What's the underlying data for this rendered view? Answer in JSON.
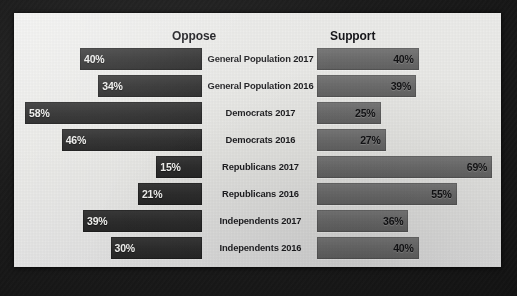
{
  "chart_data": {
    "type": "bar",
    "subtype": "tornado",
    "title": "",
    "xlabel": "",
    "ylabel": "",
    "grid": false,
    "legend_position": "top-as-column-headers",
    "categories": [
      "General Population 2017",
      "General Population 2016",
      "Democrats 2017",
      "Democrats 2016",
      "Republicans 2017",
      "Republicans 2016",
      "Independents 2017",
      "Independents 2016"
    ],
    "series": [
      {
        "name": "Oppose",
        "side": "left",
        "color": "#2d2d2d",
        "values": [
          40,
          34,
          58,
          46,
          15,
          21,
          39,
          30
        ],
        "labels": [
          "40%",
          "34%",
          "58%",
          "46%",
          "15%",
          "21%",
          "39%",
          "30%"
        ]
      },
      {
        "name": "Support",
        "side": "right",
        "color": "#6c6c6c",
        "values": [
          40,
          39,
          25,
          27,
          69,
          55,
          36,
          40
        ],
        "labels": [
          "40%",
          "39%",
          "25%",
          "27%",
          "69%",
          "55%",
          "36%",
          "40%"
        ]
      }
    ],
    "xlim_left": [
      0,
      60
    ],
    "xlim_right": [
      0,
      72
    ],
    "value_unit": "%"
  },
  "headers": {
    "oppose": "Oppose",
    "support": "Support"
  },
  "rows": [
    {
      "label": "General Population 2017",
      "oppose": "40%",
      "support": "40%",
      "oppose_value": 40,
      "support_value": 40
    },
    {
      "label": "General Population 2016",
      "oppose": "34%",
      "support": "39%",
      "oppose_value": 34,
      "support_value": 39
    },
    {
      "label": "Democrats 2017",
      "oppose": "58%",
      "support": "25%",
      "oppose_value": 58,
      "support_value": 25
    },
    {
      "label": "Democrats 2016",
      "oppose": "46%",
      "support": "27%",
      "oppose_value": 46,
      "support_value": 27
    },
    {
      "label": "Republicans 2017",
      "oppose": "15%",
      "support": "69%",
      "oppose_value": 15,
      "support_value": 69
    },
    {
      "label": "Republicans 2016",
      "oppose": "21%",
      "support": "55%",
      "oppose_value": 21,
      "support_value": 55
    },
    {
      "label": "Independents 2017",
      "oppose": "39%",
      "support": "36%",
      "oppose_value": 39,
      "support_value": 36
    },
    {
      "label": "Independents 2016",
      "oppose": "30%",
      "support": "40%",
      "oppose_value": 30,
      "support_value": 40
    }
  ],
  "colors": {
    "oppose_bar": "#2d2d2d",
    "support_bar": "#6c6c6c",
    "panel_background": "#e8e8e6",
    "frame": "#1b1b1b",
    "text": "#1d1d20"
  },
  "scale": {
    "left_px_per_percent": 3.05,
    "right_px_per_percent": 2.54
  }
}
